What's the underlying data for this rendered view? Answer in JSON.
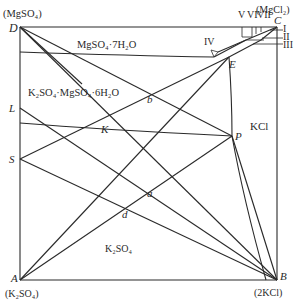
{
  "diagram": {
    "type": "phase-diagram",
    "corners": {
      "top_left": {
        "letter": "D",
        "compound": "(MgSO₄)"
      },
      "top_right": {
        "letter": "C",
        "compound": "(MgCl₂)"
      },
      "bottom_left": {
        "letter": "A",
        "compound": "(K₂SO₄)"
      },
      "bottom_right": {
        "letter": "B",
        "compound": "(2KCl)"
      }
    },
    "points": {
      "L": "L",
      "S": "S",
      "K": "K",
      "P": "P",
      "E": "E",
      "a": "a",
      "b": "b",
      "d": "d"
    },
    "regions": {
      "epsomite": "MgSO₄·7H₂O",
      "schoenite": "K₂SO₄·MgSO₄·6H₂O",
      "kcl": "KCl",
      "k2so4": "K₂SO₄"
    },
    "small_fields": {
      "I": "I",
      "II": "II",
      "III": "III",
      "IV": "IV",
      "V": "V",
      "VI": "VI",
      "VII": "VII"
    }
  }
}
